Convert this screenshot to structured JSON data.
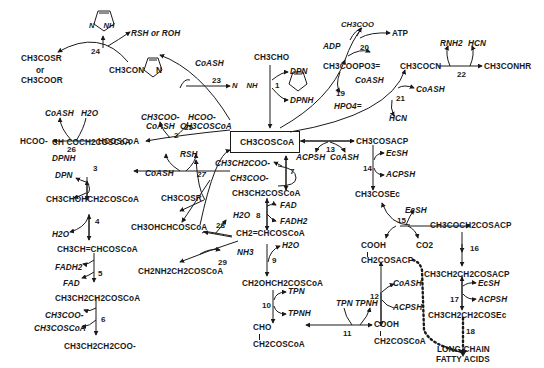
{
  "diagram": {
    "center": "CH3COSCoA",
    "nodes": {
      "imidazole_top": "N    NH",
      "rsh_or_roh": "RSH or ROH",
      "ch3cosr_top": "CH3COSR",
      "or": "or",
      "ch3coor": "CH3COOR",
      "ch3con_imid": "CH3CON",
      "imid_n": "N",
      "coash_23": "CoASH",
      "imid_23": "N    NH",
      "ch3cho": "CH3CHO",
      "dpn_1": "DPN",
      "dpnh_1": "DPNH",
      "ch3coo_20": "CH3COO",
      "adp": "ADP",
      "atp": "ATP",
      "ch3coopo3": "CH3COOPO3=",
      "coash_19": "CoASH",
      "hpo4_19": "HPO4=",
      "ch3cocn": "CH3COCN",
      "rnh2": "RNH2",
      "hcn_22": "HCN",
      "ch3conhr": "CH3CONHR",
      "coash_21": "CoASH",
      "hcn_21": "HCN",
      "coash_26": "CoASH",
      "h2o_26": "H2O",
      "hcoo_26": "HCOO-",
      "hcoscoa": "HCOSCoA",
      "ch3coo_25": "CH3COO-",
      "hcoo_25": "HCOO-",
      "coash_2": "CoASH",
      "ch3coscoa_2": "CH3COSCoA",
      "acetoacetyl": "CH COCH2COSCoA",
      "dpnh_3": "DPNH",
      "dpn_3": "DPN",
      "hydroxybutyryl": "CH3CHOHCH2COSCoA",
      "h2o_4": "H2O",
      "crotonyl": "CH3CH=CHCOSCoA",
      "fadh2_5": "FADH2",
      "fad_5": "FAD",
      "butyryl": "CH3CH2CH2COSCoA",
      "ch3coo_6": "CH3COO-",
      "ch3coscoa_6": "CH3COSCoA",
      "butyrate": "CH3CH2CH2COO-",
      "rsh_27": "RSH",
      "coash_27": "CoASH",
      "ch3cosr_27": "CH3COSR",
      "propionate": "CH3CH2COO-",
      "acetate_7": "CH3COO-",
      "propionyl": "CH3CH2COSCoA",
      "fad_8": "FAD",
      "fadh2_8": "FADH2",
      "h2o_28": "H2O",
      "hydroxypropionyl_28": "CH3OHCHCOSCoA",
      "acrylyl": "CH2=CHCOSCoA",
      "nh3_29": "NH3",
      "aminopropionyl": "CH2NH2CH2COSCoA",
      "h2o_9": "H2O",
      "hydroxypropionyl_9": "CH2OHCH2COSCoA",
      "tpn_10": "TPN",
      "tpnh_10": "TPNH",
      "cho": "CHO",
      "malonsemialdehyde": "CH2COSCoA",
      "acpsh_13": "ACPSH",
      "coash_13": "CoASH",
      "ch3cosacp": "CH3COSACP",
      "ecsh_14": "EcSH",
      "acpsh_14": "ACPSH",
      "ch3cosec": "CH3COSEc",
      "ecsh_15": "EcSH",
      "cooh_15": "COOH",
      "co2_15": "CO2",
      "acetoacetylacp": "CH3COCH2COSACP",
      "cooh_acp": "COOH",
      "malonylacp": "CH2COSACP",
      "butyrylacp": "CH3CH2CH2COSACP",
      "coash_12": "CoASH",
      "acpsh_12": "ACPSH",
      "ecsh_17": "EcSH",
      "acpsh_17": "ACPSH",
      "butyrylec": "CH3CH2CH2COSEc",
      "tpn_11": "TPN",
      "tpnh_11": "TPNH",
      "cooh_malonyl": "COOH",
      "malonylcoa": "CH2COSCoA",
      "long_chain_1": "LONG CHAIN",
      "long_chain_2": "FATTY ACIDS"
    },
    "reaction_numbers": [
      "1",
      "2",
      "3",
      "4",
      "5",
      "6",
      "7",
      "8",
      "9",
      "10",
      "11",
      "12",
      "13",
      "14",
      "15",
      "16",
      "17",
      "18",
      "19",
      "20",
      "21",
      "22",
      "23",
      "24",
      "25",
      "26",
      "27",
      "28",
      "29"
    ]
  }
}
